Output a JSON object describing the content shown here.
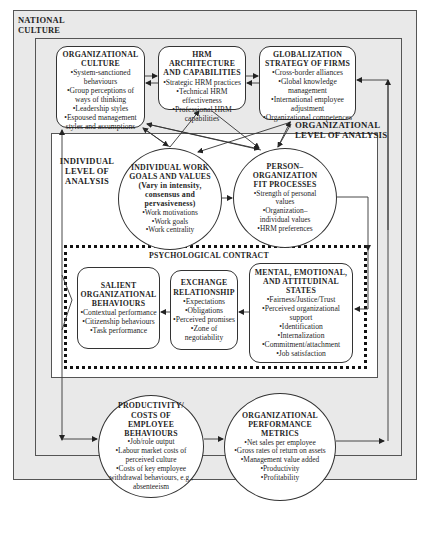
{
  "frames": {
    "national_culture": "NATIONAL\nCULTURE",
    "organizational_level": "ORGANIZATIONAL\nLEVEL OF ANALYSIS",
    "individual_level": "INDIVIDUAL\nLEVEL OF\nANALYSIS",
    "psychological_contract": "PSYCHOLOGICAL CONTRACT"
  },
  "nodes": {
    "org_culture": {
      "title": "ORGANIZATIONAL CULTURE",
      "items": [
        "•System-sanctioned behaviours",
        "•Group perceptions of ways of thinking",
        "•Leadership styles",
        "•Espoused management styles and assumptions"
      ]
    },
    "hrm_architecture": {
      "title": "HRM ARCHITECTURE AND CAPABILITIES",
      "items": [
        "•Strategic HRM practices",
        "•Technical HRM effectiveness",
        "•Professional HRM capabilities"
      ]
    },
    "globalization": {
      "title": "GLOBALIZATION STRATEGY OF FIRMS",
      "items": [
        "•Cross-border alliances",
        "•Global knowledge management",
        "•International employee adjustment",
        "•Organizational competences"
      ]
    },
    "individual_goals": {
      "title": "INDIVIDUAL WORK GOALS AND VALUES",
      "subtitle": "(Vary in intensity, consensus and pervasiveness)",
      "items": [
        "•Work motivations",
        "•Work goals",
        "•Work centrality"
      ]
    },
    "person_org_fit": {
      "title": "PERSON– ORGANIZATION FIT PROCESSES",
      "items": [
        "•Strength of personal values",
        "•Organization– individual values",
        "•HRM preferences"
      ]
    },
    "salient_behaviours": {
      "title": "SALIENT ORGANIZATIONAL BEHAVIOURS",
      "items": [
        "•Contextual performance",
        "•Citizenship behaviours",
        "•Task performance"
      ]
    },
    "exchange_relationship": {
      "title": "EXCHANGE RELATIONSHIP",
      "items": [
        "•Expectations",
        "•Obligations",
        "•Perceived promises",
        "•Zone of negotiability"
      ]
    },
    "mental_states": {
      "title": "MENTAL, EMOTIONAL, AND ATTITUDINAL STATES",
      "items": [
        "•Fairness/Justice/Trust",
        "•Perceived organizational support",
        "•Identification",
        "•Internalization",
        "•Commitment/attachment",
        "•Job satisfaction"
      ]
    },
    "productivity": {
      "title": "PRODUCTIVITY/ COSTS OF EMPLOYEE BEHAVIOURS",
      "items": [
        "•Job/role output",
        "•Labour market costs of perceived culture",
        "•Costs of key employee withdrawal behaviours, e.g., absenteeism"
      ]
    },
    "performance_metrics": {
      "title": "ORGANIZATIONAL PERFORMANCE METRICS",
      "items": [
        "•Net sales per employee",
        "•Gross rates of return on assets",
        "•Management value added",
        "•Productivity",
        "•Profitability"
      ]
    }
  },
  "colors": {
    "background": "#e9e9e9",
    "inner": "#ffffff",
    "stroke": "#333333"
  }
}
